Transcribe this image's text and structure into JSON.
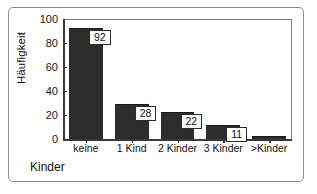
{
  "chart_data": {
    "type": "bar",
    "title": "",
    "xlabel": "Kinder",
    "ylabel": "Häufigkeit",
    "categories": [
      "keine",
      "1 Kind",
      "2 Kinder",
      "3 Kinder",
      ">Kinder"
    ],
    "values": [
      92,
      28,
      22,
      11,
      2
    ],
    "value_labels": [
      "92",
      "28",
      "22",
      "11",
      ""
    ],
    "ylim": [
      0,
      100
    ],
    "yticks": [
      0,
      20,
      40,
      60,
      80,
      100
    ],
    "ytick_labels": [
      "0",
      "20",
      "40",
      "60",
      "80",
      "100"
    ],
    "grid": false,
    "legend": false,
    "bar_color": "#2d2d2d",
    "frame_color": "#7a7a7a",
    "axis_color": "#3a3a3a",
    "label_box_bg": "#ffffff",
    "label_box_border": "#2a2a2a",
    "background": "#ffffff"
  }
}
